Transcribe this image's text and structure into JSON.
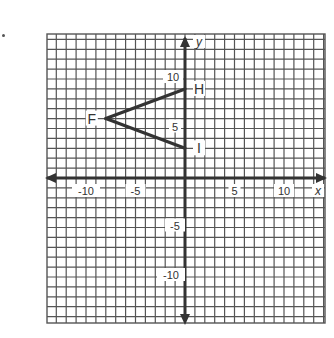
{
  "chart_data": {
    "type": "scatter",
    "title": "",
    "xlabel": "x",
    "ylabel": "y",
    "xlim": [
      -14,
      14
    ],
    "ylim": [
      -14,
      14
    ],
    "grid": true,
    "x_tick_labels": [
      "-10",
      "-5",
      "5",
      "10"
    ],
    "y_tick_labels": [
      "10",
      "5",
      "-5",
      "-10"
    ],
    "points": [
      {
        "label": "F",
        "x": -8,
        "y": 6
      },
      {
        "label": "H",
        "x": 0,
        "y": 9
      },
      {
        "label": "I",
        "x": 0,
        "y": 3
      }
    ],
    "segments": [
      {
        "from": "F",
        "to": "H"
      },
      {
        "from": "F",
        "to": "I"
      }
    ]
  },
  "colors": {
    "grid": "#555555",
    "axis": "#333333",
    "segment": "#333333",
    "background": "#ffffff"
  }
}
